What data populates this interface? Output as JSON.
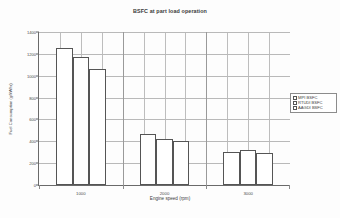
{
  "chart_data": {
    "type": "bar",
    "title": "BSFC at part load operation",
    "xlabel": "Engine speed (rpm)",
    "ylabel": "Fuel Consumption (g/kWhr)",
    "categories": [
      "1000",
      "2000",
      "3000"
    ],
    "series": [
      {
        "name": "MPI BSFC",
        "values": [
          1250,
          465,
          305
        ]
      },
      {
        "name": "RTUDI BSFC",
        "values": [
          1175,
          425,
          320
        ]
      },
      {
        "name": "AAGDI BSFC",
        "values": [
          1060,
          400,
          290
        ]
      }
    ],
    "ylim": [
      0,
      1400
    ],
    "yticks": [
      0,
      200,
      400,
      600,
      800,
      1000,
      1200,
      1400
    ],
    "ytick_labels": [
      "0",
      "200",
      "400",
      "600",
      "800",
      "1000",
      "1200",
      "1400"
    ],
    "grid": true,
    "legend_position": "right",
    "bar_fill": "#ffffff",
    "bar_border": "#555555",
    "grid_color": "#b9b9b9",
    "axis_color": "#6a6a6a"
  }
}
